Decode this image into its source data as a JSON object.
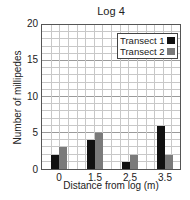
{
  "chart_data": {
    "type": "bar",
    "title": "Log 4",
    "xlabel": "Distance from log (m)",
    "ylabel": "Number of millipedes",
    "categories": [
      "0",
      "1.5",
      "2.5",
      "3.5"
    ],
    "series": [
      {
        "name": "Transect 1",
        "color": "#111111",
        "values": [
          2,
          4,
          1,
          6
        ]
      },
      {
        "name": "Transect 2",
        "color": "#7a7a7a",
        "values": [
          3,
          5,
          2,
          2
        ]
      }
    ],
    "ylim": [
      0,
      20
    ],
    "yticks": [
      "0",
      "5",
      "10",
      "15",
      "20"
    ],
    "grid": true,
    "legend_position": "upper right"
  }
}
